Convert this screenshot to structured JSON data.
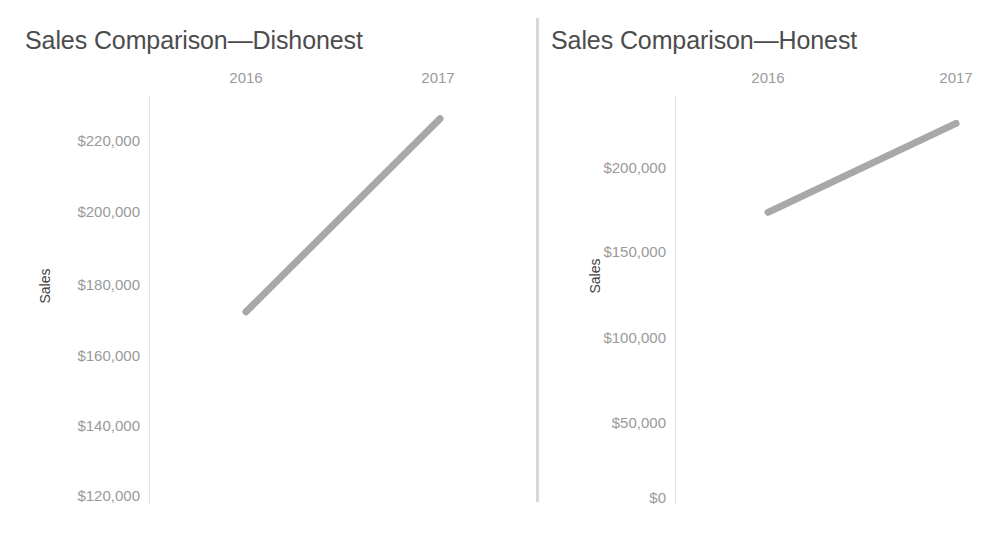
{
  "page": {
    "background_color": "#ffffff",
    "divider_color": "#d8d8d8",
    "line_color": "#a8a8a8",
    "axis_color": "#e3e3e3",
    "tick_label_color": "#9a9a9a",
    "title_color": "#4c4c4c"
  },
  "bottom_caption": {
    "text": "FIGURE 1. Comparison of sales growth using two different scales"
  },
  "chart_data": [
    {
      "id": "dishonest",
      "type": "line",
      "title": "Sales Comparison—Dishonest",
      "xlabel": "",
      "ylabel": "Sales",
      "categories": [
        "2016",
        "2017"
      ],
      "x": [
        2016,
        2017
      ],
      "values": [
        172300,
        224800
      ],
      "series": [
        {
          "name": "Sales",
          "values": [
            172300,
            224800
          ]
        }
      ],
      "ylim": [
        120000,
        231000
      ],
      "yticks": [
        220000,
        200000,
        180000,
        160000,
        140000,
        120000
      ],
      "ytick_labels": [
        "$220,000",
        "$200,000",
        "$180,000",
        "$160,000",
        "$140,000",
        "$120,000"
      ],
      "xtick_labels": [
        "2016",
        "2017"
      ],
      "grid": false,
      "legend": "none",
      "axis_position": "x-axis-top",
      "line_color": "#a8a8a8"
    },
    {
      "id": "honest",
      "type": "line",
      "title": "Sales Comparison—Honest",
      "xlabel": "",
      "ylabel": "Sales",
      "categories": [
        "2016",
        "2017"
      ],
      "x": [
        2016,
        2017
      ],
      "values": [
        172300,
        224800
      ],
      "series": [
        {
          "name": "Sales",
          "values": [
            172300,
            224800
          ]
        }
      ],
      "ylim": [
        0,
        241000
      ],
      "yticks": [
        200000,
        150000,
        100000,
        50000,
        0
      ],
      "ytick_labels": [
        "$200,000",
        "$150,000",
        "$100,000",
        "$50,000",
        "$0"
      ],
      "xtick_labels": [
        "2016",
        "2017"
      ],
      "grid": false,
      "legend": "none",
      "axis_position": "x-axis-top",
      "line_color": "#a8a8a8"
    }
  ]
}
